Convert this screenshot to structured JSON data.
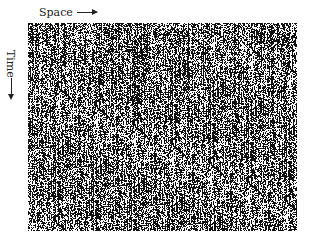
{
  "diagram": {
    "type": "space-time diagram",
    "x_axis_label": "Space",
    "y_axis_label": "Time",
    "x_direction": "right",
    "y_direction": "down",
    "pattern": "black/white noisy vertical streaks (spatiotemporal chaos)",
    "colors": {
      "foreground": "#111111",
      "background": "#ffffff"
    }
  }
}
